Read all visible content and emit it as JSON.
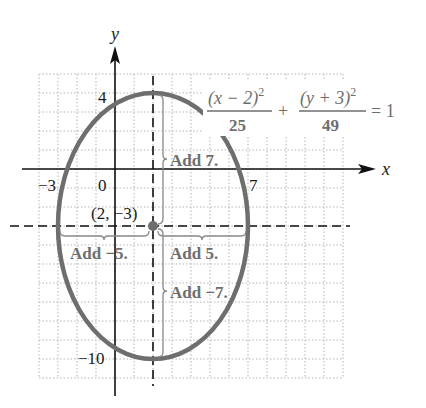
{
  "chart_data": {
    "type": "line",
    "title": "",
    "xlabel": "x",
    "ylabel": "y",
    "equation": {
      "num1": "(x − 2)",
      "sup1": "2",
      "den1": "25",
      "plus": "+",
      "num2": "(y + 3)",
      "sup2": "2",
      "den2": "49",
      "rhs": "= 1"
    },
    "ellipse": {
      "center": [
        2,
        -3
      ],
      "a_horizontal": 5,
      "b_vertical": 7,
      "vertices": [
        [
          -3,
          -3
        ],
        [
          7,
          -3
        ],
        [
          2,
          4
        ],
        [
          2,
          -10
        ]
      ]
    },
    "x_tick_labels": [
      {
        "value": -3,
        "label": "−3"
      },
      {
        "value": 0,
        "label": "0"
      },
      {
        "value": 7,
        "label": "7"
      }
    ],
    "y_tick_labels": [
      {
        "value": 4,
        "label": "4"
      },
      {
        "value": -10,
        "label": "−10"
      }
    ],
    "annotations": {
      "center_label": "(2, −3)",
      "add_up": "Add 7.",
      "add_left": "Add −5.",
      "add_right": "Add 5.",
      "add_down": "Add −7."
    },
    "xlim": [
      -4,
      12
    ],
    "ylim": [
      -11,
      5
    ],
    "grid": true,
    "colors": {
      "ellipse": "#6e6e6e",
      "axes": "#111111",
      "grid": "#b5b5b5",
      "annotation": "#6e6e6e"
    }
  }
}
